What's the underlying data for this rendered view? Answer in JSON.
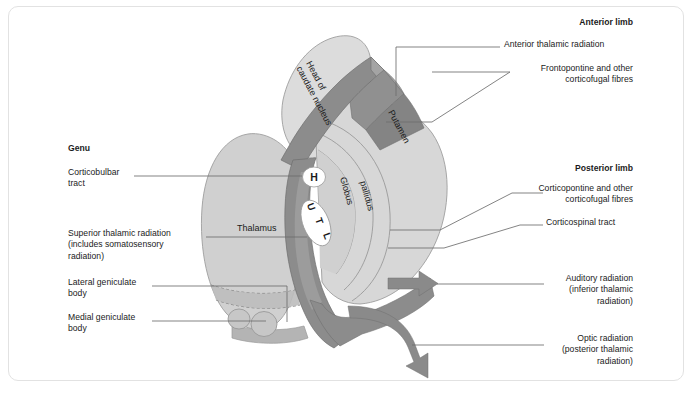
{
  "figure": {
    "caption": "",
    "border_color": "#e2e2e2",
    "background": "#ffffff"
  },
  "palette": {
    "capsule_band": "#8c8c8c",
    "capsule_band_dark": "#7d7d7d",
    "nucleus_light": "#d4d4d4",
    "nucleus_lighter": "#dcdcdc",
    "thalamus": "#cfcfcf",
    "arrow": "#8a8a8a",
    "outline": "#9a9a9a",
    "leader": "#6e6e6e",
    "text": "#1b1b1b"
  },
  "structure_labels": [
    {
      "id": "head-of-caudate-nucleus",
      "text": "Head of\ncaudate nucleus",
      "x": 300,
      "y": 62,
      "rotate": 62
    },
    {
      "id": "putamen",
      "text": "Putamen",
      "x": 392,
      "y": 110,
      "rotate": 62
    },
    {
      "id": "globus",
      "text": "Globus",
      "x": 344,
      "y": 186,
      "rotate": 74
    },
    {
      "id": "pallidus",
      "text": "pallidus",
      "x": 364,
      "y": 190,
      "rotate": 74
    },
    {
      "id": "thalamus",
      "text": "Thalamus",
      "x": 240,
      "y": 228,
      "rotate": 0
    }
  ],
  "somatotopic_markers": [
    {
      "id": "marker-head",
      "letter": "H",
      "cx": 314,
      "cy": 177,
      "rx": 11,
      "ry": 9.5,
      "rotate": 0
    },
    {
      "id": "marker-upper-limb",
      "letter": "U",
      "cx": 309,
      "cy": 212,
      "rotate": 70
    },
    {
      "id": "marker-trunk",
      "letter": "T",
      "cx": 317,
      "cy": 223,
      "rotate": 70
    },
    {
      "id": "marker-lower-limb",
      "letter": "L",
      "cx": 325,
      "cy": 235,
      "rotate": 70
    }
  ],
  "left_labels": [
    {
      "id": "genu",
      "text": "Genu",
      "bold": true,
      "x": 68,
      "y": 148,
      "align": "left"
    },
    {
      "id": "corticobulbar-tract",
      "text": "Corticobulbar\ntract",
      "bold": false,
      "x": 68,
      "y": 172,
      "align": "left"
    },
    {
      "id": "superior-thalamic-radiation",
      "text": "Superior thalamic radiation\n(includes somatosensory\nradiation)",
      "bold": false,
      "x": 68,
      "y": 232,
      "align": "left"
    },
    {
      "id": "lateral-geniculate-body",
      "text": "Lateral geniculate\nbody",
      "bold": false,
      "x": 68,
      "y": 281,
      "align": "left"
    },
    {
      "id": "medial-geniculate-body",
      "text": "Medial geniculate\nbody",
      "bold": false,
      "x": 68,
      "y": 316,
      "align": "left"
    }
  ],
  "right_labels": [
    {
      "id": "anterior-limb",
      "text": "Anterior limb",
      "bold": true,
      "x": 533,
      "y": 21,
      "align": "left"
    },
    {
      "id": "anterior-thalamic-radiation",
      "text": "Anterior thalamic radiation",
      "bold": false,
      "x": 505,
      "y": 43,
      "align": "left"
    },
    {
      "id": "frontopontine-and-other-corticofugal-fibres",
      "text": "Frontopontine and other\ncorticofugal fibres",
      "bold": false,
      "x": 515,
      "y": 67,
      "align": "left"
    },
    {
      "id": "posterior-limb",
      "text": "Posterior limb",
      "bold": true,
      "x": 525,
      "y": 167,
      "align": "left"
    },
    {
      "id": "corticopontine-and-other-corticofugal-fibres",
      "text": "Corticopontine and other\ncorticofugal fibres",
      "bold": false,
      "x": 515,
      "y": 187,
      "align": "left"
    },
    {
      "id": "corticospinal-tract",
      "text": "Corticospinal tract",
      "bold": false,
      "x": 547,
      "y": 221,
      "align": "left"
    },
    {
      "id": "auditory-radiation",
      "text": "Auditory radiation\n(inferior thalamic\nradiation)",
      "bold": false,
      "x": 548,
      "y": 277,
      "align": "left"
    },
    {
      "id": "optic-radiation",
      "text": "Optic radiation\n(posterior thalamic\nradiation)",
      "bold": false,
      "x": 548,
      "y": 337,
      "align": "left"
    }
  ],
  "arrows": [
    {
      "id": "auditory-radiation-arrow",
      "label": "Auditory radiation arrow"
    },
    {
      "id": "optic-radiation-arrow",
      "label": "Optic radiation arrow"
    }
  ]
}
